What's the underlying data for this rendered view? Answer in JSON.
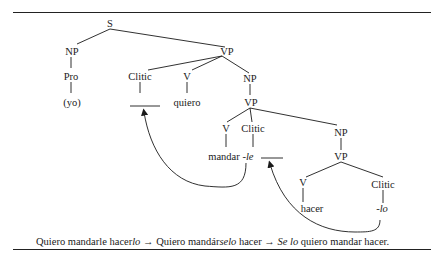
{
  "tree": {
    "nodes": {
      "S": "S",
      "NP1": "NP",
      "Pro": "Pro",
      "yo": "(yo)",
      "VP1": "VP",
      "Clitic1": "Clitic",
      "V1": "V",
      "quiero": "quiero",
      "NP2": "NP",
      "VP2": "VP",
      "V2": "V",
      "mandar": "mandar",
      "Clitic2": "Clitic",
      "le": "-le",
      "NP3": "NP",
      "VP3": "VP",
      "V3": "V",
      "hacer": "hacer",
      "Clitic3": "Clitic",
      "lo": "-lo"
    }
  },
  "caption": {
    "p1": "Quiero mandarle hacer",
    "p1_it": "lo",
    "arrow1": " → ",
    "p2": "Quiero mandár",
    "p2_it": "selo",
    "p3": " hacer",
    "arrow2": " → ",
    "p4_it": "Se lo",
    "p5": " quiero mandar hacer."
  }
}
